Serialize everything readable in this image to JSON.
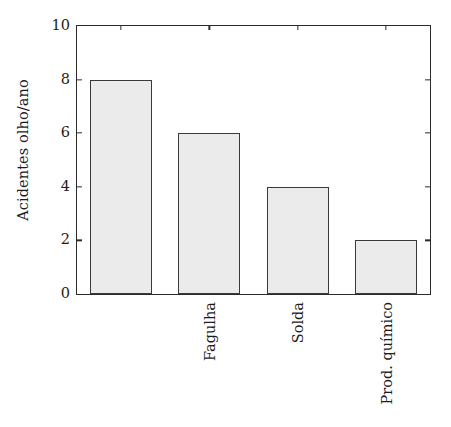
{
  "chart_data": {
    "type": "bar",
    "title": "",
    "subtitle": "",
    "xlabel": "",
    "ylabel": "Acidentes olho/ano",
    "categories": [
      "Fagulha",
      "Solda",
      "Prod. químico",
      "Outros"
    ],
    "values": [
      8,
      6,
      4,
      2
    ],
    "ylim": [
      0,
      10
    ],
    "yticks": [
      0,
      2,
      4,
      6,
      8,
      10
    ],
    "ytick_labels": [
      "0",
      "2",
      "4",
      "6",
      "8",
      "10"
    ],
    "grid": false,
    "legend": null,
    "legend_position": "none",
    "annotations": [],
    "bar_fill_color": "#ebebeb",
    "bar_edge_color": "#3a3a3a",
    "axis_color": "#2b2b2b",
    "background_color": "#ffffff",
    "text_color": "#1c1c1c"
  }
}
